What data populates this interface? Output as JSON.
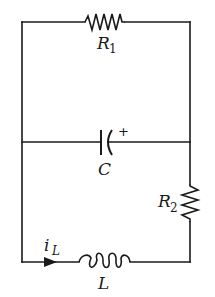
{
  "diagram": {
    "type": "electrical circuit schematic",
    "components": {
      "r1": {
        "symbol": "resistor",
        "label": "R",
        "subscript": "1",
        "position": "top branch"
      },
      "c": {
        "symbol": "capacitor",
        "label": "C",
        "polarity_mark": "+",
        "position": "middle branch"
      },
      "r2": {
        "symbol": "resistor",
        "label": "R",
        "subscript": "2",
        "position": "right side, lower loop"
      },
      "l": {
        "symbol": "inductor",
        "label": "L",
        "position": "bottom branch"
      }
    },
    "current": {
      "label": "i",
      "subscript": "L",
      "direction": "left-to-right along bottom wire"
    },
    "colors": {
      "line": "#1a1a1a",
      "background": "#ffffff"
    }
  }
}
